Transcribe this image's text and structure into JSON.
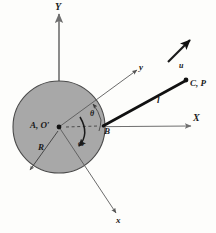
{
  "figure": {
    "background_color": "#fdfdfb",
    "disk": {
      "name": "crank-disk",
      "fill_color": "#a8a8a8",
      "stroke_color": "#4a4a4a",
      "center_x": 59,
      "center_y": 127,
      "radius": 46
    },
    "labels": {
      "axis_Y": "Y",
      "axis_X": "X",
      "axis_y_body": "y",
      "axis_x_body": "x",
      "velocity_u": "u",
      "point_CP": "C, P",
      "rod_length": "l",
      "point_B": "B",
      "point_AO": "A, O′",
      "radius_R": "R",
      "angle_theta": "θ",
      "angular_velocity_omega": "ω"
    },
    "points": {
      "A_O_prime": {
        "x": 59,
        "y": 127
      },
      "B": {
        "x": 104,
        "y": 126
      },
      "C_P": {
        "x": 186,
        "y": 80
      }
    },
    "colors": {
      "disk_fill": "#a8a8a8",
      "disk_edge": "#4a4a4a",
      "thin_line": "#555555",
      "thick_rod": "#111111",
      "text": "#1a1a1a",
      "axis_line": "#6f6f6f"
    }
  }
}
